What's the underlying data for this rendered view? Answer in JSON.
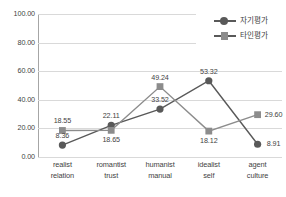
{
  "chart_data": {
    "type": "line",
    "title": "",
    "xlabel": "",
    "ylabel": "",
    "ylim": [
      0,
      100
    ],
    "yticks": [
      "0.00",
      "20.00",
      "40.00",
      "60.00",
      "80.00",
      "100.00"
    ],
    "grid": true,
    "legend_position": "top-right",
    "categories": [
      {
        "line1": "realist",
        "line2": "relation"
      },
      {
        "line1": "romantist",
        "line2": "trust"
      },
      {
        "line1": "humanist",
        "line2": "manual"
      },
      {
        "line1": "idealist",
        "line2": "self"
      },
      {
        "line1": "agent",
        "line2": "culture"
      }
    ],
    "series": [
      {
        "name": "자기평가",
        "marker": "circle",
        "color": "#595959",
        "values": [
          8.36,
          22.11,
          33.52,
          53.32,
          8.91
        ],
        "labels": [
          "8.36",
          "22.11",
          "33.52",
          "53.32",
          "8.91"
        ]
      },
      {
        "name": "타인평가",
        "marker": "square",
        "color": "#8c8c8c",
        "values": [
          18.55,
          18.65,
          49.24,
          18.12,
          29.6
        ],
        "labels": [
          "18.55",
          "18.65",
          "49.24",
          "18.12",
          "29.60"
        ]
      }
    ]
  },
  "legend": {
    "items": [
      {
        "label": "자기평가",
        "marker": "circle"
      },
      {
        "label": "타인평가",
        "marker": "square"
      }
    ]
  },
  "colors": {
    "series1": "#595959",
    "series2": "#8c8c8c",
    "grid": "#d9d9d9",
    "axis": "#a6a6a6",
    "text": "#3f3f3f"
  }
}
